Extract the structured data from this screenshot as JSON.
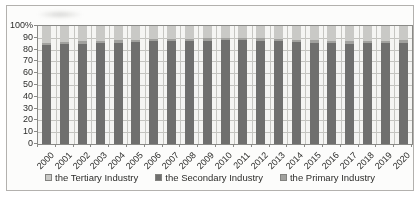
{
  "chart_data": {
    "type": "bar",
    "stacked": true,
    "percent_stacked": true,
    "title": "",
    "categories": [
      "2000",
      "2001",
      "2002",
      "2003",
      "2004",
      "2005",
      "2006",
      "2007",
      "2008",
      "2009",
      "2010",
      "2011",
      "2012",
      "2013",
      "2014",
      "2015",
      "2016",
      "2017",
      "2018",
      "2019",
      "2020"
    ],
    "series": [
      {
        "name": "the Tertiary Industry",
        "color": "#c9c9c6",
        "values": [
          14,
          13.5,
          13,
          12.5,
          12,
          11.5,
          11,
          11,
          11,
          10.5,
          10,
          10,
          10.5,
          11,
          11.5,
          12,
          12.5,
          13,
          12.5,
          12.5,
          12
        ]
      },
      {
        "name": "the Secondary Industry",
        "color": "#6f6f6e",
        "values": [
          84,
          84.5,
          85,
          85.5,
          86,
          86.5,
          87,
          87,
          87,
          87.5,
          88,
          88,
          87.5,
          87,
          86.5,
          86,
          85.5,
          85,
          85.5,
          85.5,
          86
        ]
      },
      {
        "name": "the Primary Industry",
        "color": "#a1a19e",
        "values": [
          2,
          2,
          2,
          2,
          2,
          2,
          2,
          2,
          2,
          2,
          2,
          2,
          2,
          2,
          2,
          2,
          2,
          2,
          2,
          2,
          2
        ]
      }
    ],
    "stack_order_bottom_to_top": [
      "the Secondary Industry",
      "the Primary Industry",
      "the Tertiary Industry"
    ],
    "y_ticks": [
      "100%",
      "90",
      "80",
      "70",
      "60",
      "50",
      "40",
      "30",
      "20",
      "10",
      "0"
    ],
    "ylim": [
      0,
      100
    ],
    "grid": "both",
    "legend_position": "bottom"
  },
  "legend": {
    "items": [
      {
        "label": "the Tertiary Industry",
        "color": "#c9c9c6"
      },
      {
        "label": "the Secondary Industry",
        "color": "#6f6f6e"
      },
      {
        "label": "the Primary Industry",
        "color": "#a1a19e"
      }
    ]
  }
}
